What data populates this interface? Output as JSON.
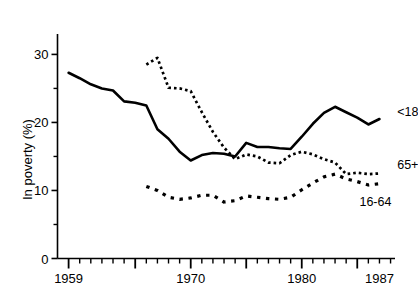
{
  "chart_data": {
    "type": "line",
    "title": "",
    "xlabel": "",
    "ylabel": "In poverty (%)",
    "xlim": [
      1958,
      1988.4
    ],
    "ylim": [
      0,
      33
    ],
    "grid": false,
    "legend_position": "right-inline-labels",
    "y_ticks_labeled": [
      0,
      10,
      20,
      30
    ],
    "y_ticks_minor": [
      5,
      15,
      25
    ],
    "x_ticks_labeled": [
      1959,
      1970,
      1980,
      1987
    ],
    "x_ticks_major": [
      1959,
      1965,
      1970,
      1975,
      1980,
      1985
    ],
    "x_ticks_minor": [
      1960,
      1961,
      1962,
      1963,
      1964,
      1966,
      1967,
      1968,
      1969,
      1971,
      1972,
      1973,
      1974,
      1976,
      1977,
      1978,
      1979,
      1981,
      1982,
      1983,
      1984,
      1986,
      1987,
      1988
    ],
    "series": [
      {
        "name": "<18",
        "style": "solid",
        "color": "#000000",
        "label": "<18",
        "label_x": 1988.6,
        "label_y": 21.6,
        "x": [
          1959,
          1960,
          1961,
          1962,
          1963,
          1964,
          1965,
          1966,
          1967,
          1968,
          1969,
          1970,
          1971,
          1972,
          1973,
          1974,
          1975,
          1976,
          1977,
          1978,
          1979,
          1980,
          1981,
          1982,
          1983,
          1984,
          1985,
          1986,
          1987
        ],
        "values": [
          27.3,
          26.5,
          25.6,
          25.0,
          24.7,
          23.1,
          22.9,
          22.5,
          19.0,
          17.6,
          15.7,
          14.4,
          15.2,
          15.5,
          15.4,
          15.0,
          17.0,
          16.4,
          16.4,
          16.2,
          16.1,
          17.9,
          19.8,
          21.4,
          22.3,
          21.5,
          20.7,
          19.7,
          20.5
        ]
      },
      {
        "name": "65+",
        "style": "dotted-fine",
        "color": "#000000",
        "label": "65+",
        "label_x": 1988.6,
        "label_y": 13.8,
        "x": [
          1966,
          1967,
          1968,
          1969,
          1970,
          1971,
          1972,
          1973,
          1974,
          1975,
          1976,
          1977,
          1978,
          1979,
          1980,
          1981,
          1982,
          1983,
          1984,
          1985,
          1986,
          1987
        ],
        "values": [
          28.5,
          29.5,
          25.1,
          25.0,
          24.6,
          21.5,
          18.6,
          16.3,
          14.6,
          15.3,
          15.0,
          14.1,
          14.0,
          15.2,
          15.7,
          15.3,
          14.6,
          14.1,
          12.4,
          12.6,
          12.4,
          12.5
        ]
      },
      {
        "name": "16-64",
        "style": "dashed-coarse",
        "color": "#000000",
        "label": "16-64",
        "label_x": 1985.2,
        "label_y": 8.3,
        "x": [
          1966,
          1967,
          1968,
          1969,
          1970,
          1971,
          1972,
          1973,
          1974,
          1975,
          1976,
          1977,
          1978,
          1979,
          1980,
          1981,
          1982,
          1983,
          1984,
          1985,
          1986,
          1987
        ],
        "values": [
          10.6,
          10.0,
          9.0,
          8.7,
          8.9,
          9.3,
          9.3,
          8.3,
          8.5,
          9.2,
          9.0,
          8.8,
          8.7,
          9.0,
          10.1,
          11.1,
          12.0,
          12.4,
          11.7,
          11.3,
          10.8,
          11.0
        ]
      }
    ]
  },
  "axis": {
    "y_label_text": "In poverty (%)",
    "y_tick_labels": [
      "0",
      "10",
      "20",
      "30"
    ],
    "x_tick_labels": [
      "1959",
      "1970",
      "1980",
      "1987"
    ]
  }
}
